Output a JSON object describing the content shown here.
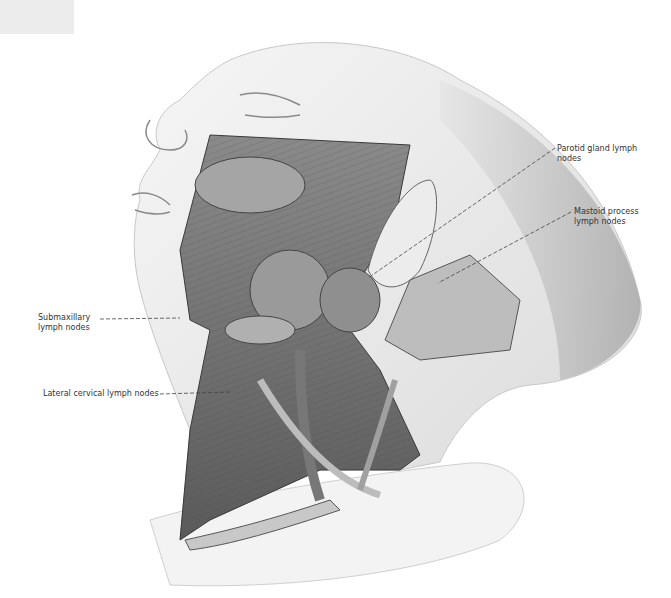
{
  "figure": {
    "background_color": "#ffffff",
    "ink_color": "#333333",
    "corner_swatch_color": "#ececec"
  },
  "labels": [
    {
      "id": "parotid",
      "text": "Parotid gland lymph\nnodes",
      "anchor": [
        555,
        148
      ],
      "target": [
        368,
        278
      ]
    },
    {
      "id": "mastoid",
      "text": "Mastoid process\nlymph nodes",
      "anchor": [
        571,
        212
      ],
      "target": [
        438,
        283
      ]
    },
    {
      "id": "submaxillary",
      "text": "Submaxillary\nlymph nodes",
      "anchor": [
        94,
        318
      ],
      "target": [
        180,
        318
      ]
    },
    {
      "id": "lateral_cervical",
      "text": "Lateral cervical lymph nodes",
      "anchor": [
        158,
        394
      ],
      "target": [
        230,
        392
      ]
    }
  ]
}
